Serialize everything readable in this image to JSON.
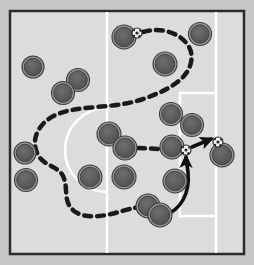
{
  "diagram": {
    "type": "sports-play-diagram",
    "sport": "soccer",
    "canvas": {
      "width": 254,
      "height": 265
    },
    "colors": {
      "outer_background": "#c8c8c8",
      "pitch_fill": "#dcdcdc",
      "pitch_border": "#2b2b2b",
      "field_line": "#ffffff",
      "player_fill": "#5a5a5a",
      "player_ring": "#9a9a9a",
      "player_edge": "#3c3c3c",
      "dashed_path": "#1a1a1a",
      "solid_arrow": "#111111",
      "ball_fill": "#f2f2f2",
      "ball_marking": "#2a2a2a"
    },
    "pitch": {
      "name": "attacking-half-pitch",
      "rect": {
        "x": 10,
        "y": 11,
        "width": 234,
        "height": 243
      },
      "border_width": 2.5,
      "lines": [
        {
          "name": "halfway-line",
          "type": "vertical",
          "x": 107,
          "y1": 11,
          "y2": 254
        },
        {
          "name": "penalty-area-line-vertical",
          "type": "vertical",
          "x": 216,
          "y1": 11,
          "y2": 254
        },
        {
          "name": "center-circle-arc",
          "type": "arc",
          "cx": 107,
          "cy": 150,
          "r": 42,
          "description": "left-bulging arc from halfway line"
        },
        {
          "name": "penalty-box-top",
          "type": "horizontal",
          "y": 93,
          "x1": 180,
          "x2": 216
        },
        {
          "name": "penalty-box-left",
          "type": "vertical",
          "x": 180,
          "y1": 93,
          "y2": 216
        },
        {
          "name": "penalty-box-bottom",
          "type": "horizontal",
          "y": 216,
          "x1": 180,
          "x2": 216
        }
      ]
    },
    "players": [
      {
        "id": "p1",
        "name": "player-marker",
        "cx": 33,
        "cy": 67,
        "r": 11
      },
      {
        "id": "p2",
        "name": "player-marker",
        "cx": 78,
        "cy": 80,
        "r": 11.5
      },
      {
        "id": "p3",
        "name": "player-marker",
        "cx": 63,
        "cy": 93,
        "r": 11.5
      },
      {
        "id": "p4",
        "name": "player-marker",
        "cx": 124,
        "cy": 37,
        "r": 12
      },
      {
        "id": "p5",
        "name": "player-marker",
        "cx": 200,
        "cy": 34,
        "r": 11.5
      },
      {
        "id": "p6",
        "name": "player-marker",
        "cx": 165,
        "cy": 64,
        "r": 12
      },
      {
        "id": "p7",
        "name": "player-marker",
        "cx": 25,
        "cy": 153,
        "r": 11
      },
      {
        "id": "p8",
        "name": "player-marker",
        "cx": 26,
        "cy": 180,
        "r": 11.5
      },
      {
        "id": "p9",
        "name": "player-marker",
        "cx": 109,
        "cy": 134,
        "r": 12
      },
      {
        "id": "p10",
        "name": "player-marker",
        "cx": 125,
        "cy": 148,
        "r": 12
      },
      {
        "id": "p11",
        "name": "player-marker",
        "cx": 171,
        "cy": 114,
        "r": 11.5
      },
      {
        "id": "p12",
        "name": "player-marker",
        "cx": 192,
        "cy": 125,
        "r": 11.5
      },
      {
        "id": "p13",
        "name": "player-marker",
        "cx": 172,
        "cy": 147,
        "r": 12
      },
      {
        "id": "p14",
        "name": "player-marker",
        "cx": 90,
        "cy": 177,
        "r": 12
      },
      {
        "id": "p15",
        "name": "player-marker",
        "cx": 124,
        "cy": 177,
        "r": 12
      },
      {
        "id": "p16",
        "name": "player-marker",
        "cx": 175,
        "cy": 181,
        "r": 12
      },
      {
        "id": "p17",
        "name": "player-marker",
        "cx": 148,
        "cy": 206,
        "r": 12
      },
      {
        "id": "p18",
        "name": "player-marker",
        "cx": 160,
        "cy": 215,
        "r": 12
      },
      {
        "id": "p19",
        "name": "player-marker",
        "cx": 222,
        "cy": 155,
        "r": 12
      }
    ],
    "balls": [
      {
        "id": "b1",
        "name": "ball-start",
        "cx": 137,
        "cy": 33,
        "r": 5
      },
      {
        "id": "b2",
        "name": "ball-mid",
        "cx": 186,
        "cy": 150,
        "r": 5
      },
      {
        "id": "b3",
        "name": "ball-end",
        "cx": 218,
        "cy": 142,
        "r": 5
      }
    ],
    "paths": [
      {
        "id": "dashed-run",
        "name": "dashed-movement-path",
        "style": "dashed",
        "stroke_width": 4.5,
        "dash": "7 6",
        "d": "M 143 32 C 170 24 196 42 191 62 C 188 80 165 92 140 100 C 112 109 80 105 58 114 C 38 122 30 140 38 155 C 44 166 58 166 63 176 C 69 188 62 201 74 211 C 86 220 106 216 122 211 C 132 208 140 207 146 206"
      },
      {
        "id": "dashed-pass",
        "name": "dashed-pass-line",
        "style": "dashed",
        "stroke_width": 4.5,
        "dash": "7 6",
        "d": "M 138 148 L 181 150"
      },
      {
        "id": "solid-run",
        "name": "solid-run-arrow",
        "style": "solid",
        "stroke_width": 3.5,
        "arrowhead": true,
        "d": "M 163 216 C 182 210 190 192 188 172 C 187 164 186 160 186 156"
      },
      {
        "id": "solid-pass",
        "name": "solid-pass-arrow",
        "style": "solid",
        "stroke_width": 3.5,
        "arrowhead": true,
        "d": "M 191 147 L 212 139"
      }
    ]
  }
}
